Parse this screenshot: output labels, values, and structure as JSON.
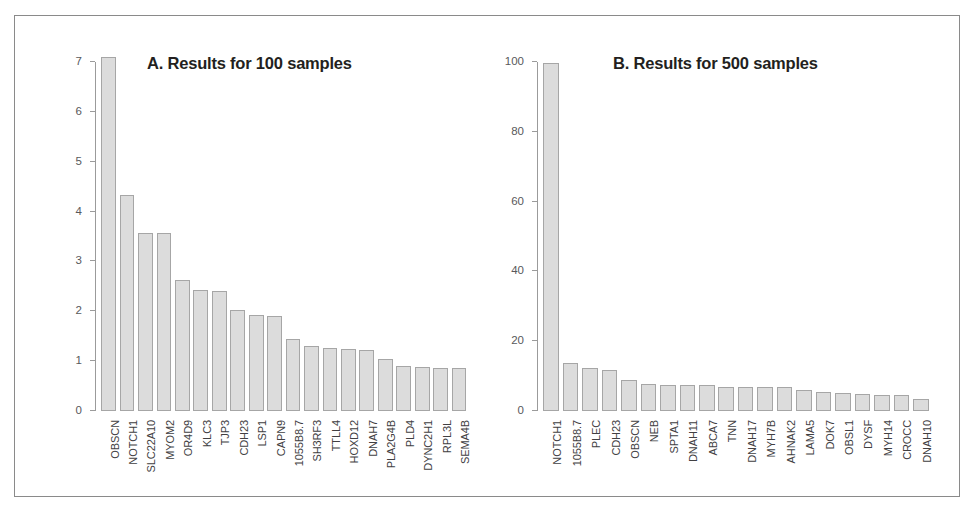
{
  "figure": {
    "border_color": "#8a8a8a",
    "bar_fill": "#dcdcdc",
    "bar_stroke": "#a6a6a6",
    "axis_color": "#9b9b9b",
    "text_color": "#414042"
  },
  "chart_data": [
    {
      "type": "bar",
      "panel": "A",
      "title": "A. Results for 100 samples",
      "xlabel": "",
      "ylabel": "",
      "ylim": [
        0,
        7
      ],
      "yticks": [
        0,
        1,
        2,
        3,
        4,
        5,
        6,
        7
      ],
      "ytick_labels": [
        "0",
        "1",
        "2",
        "3",
        "4",
        "5",
        "6",
        "7"
      ],
      "grid": false,
      "legend": "none",
      "categories": [
        "OBSCN",
        "NOTCH1",
        "SLC22A10",
        "MYOM2",
        "OR4D9",
        "KLC3",
        "TJP3",
        "CDH23",
        "LSP1",
        "CAPN9",
        "1055B8.7",
        "SH3RF3",
        "TTLL4",
        "HOXD12",
        "DNAH7",
        "PLA2G4B",
        "PLD4",
        "DYNC2H1",
        "RPL3L",
        "SEMA4B"
      ],
      "values": [
        7.1,
        4.33,
        3.58,
        3.58,
        2.62,
        2.43,
        2.41,
        2.02,
        1.92,
        1.9,
        1.45,
        1.31,
        1.27,
        1.24,
        1.22,
        1.04,
        0.9,
        0.88,
        0.87,
        0.87
      ]
    },
    {
      "type": "bar",
      "panel": "B",
      "title": "B. Results for 500 samples",
      "xlabel": "",
      "ylabel": "",
      "ylim": [
        0,
        100
      ],
      "yticks": [
        0,
        20,
        40,
        60,
        80,
        100
      ],
      "ytick_labels": [
        "0",
        "20",
        "40",
        "60",
        "80",
        "100"
      ],
      "grid": false,
      "legend": "none",
      "categories": [
        "NOTCH1",
        "1055B8.7",
        "PLEC",
        "CDH23",
        "OBSCN",
        "NEB",
        "SPTA1",
        "DNAH11",
        "ABCA7",
        "TNN",
        "DNAH17",
        "MYH7B",
        "AHNAK2",
        "LAMA5",
        "DOK7",
        "OBSL1",
        "DYSF",
        "MYH14",
        "CROCC",
        "DNAH10"
      ],
      "values": [
        99.8,
        13.8,
        12.3,
        11.8,
        9.0,
        7.6,
        7.5,
        7.5,
        7.4,
        7.0,
        7.0,
        6.9,
        6.8,
        6.0,
        5.5,
        5.1,
        4.8,
        4.6,
        4.5,
        3.4
      ]
    }
  ]
}
